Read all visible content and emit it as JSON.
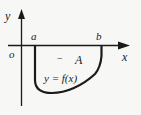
{
  "diagram": {
    "labels": {
      "y_axis": "y",
      "x_axis": "x",
      "origin": "o",
      "a": "a",
      "b": "b",
      "sign": "−",
      "area": "A",
      "function": "y = f(x)"
    },
    "colors": {
      "stroke": "#1a1a1a",
      "background": "#f7f7f5"
    }
  }
}
